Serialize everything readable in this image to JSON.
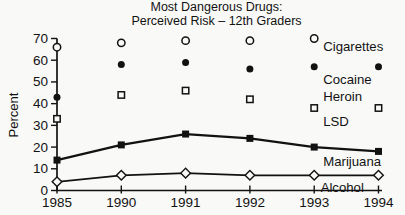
{
  "colors": {
    "ink": "#121212",
    "background": "#f9f9f7"
  },
  "chart_data": {
    "type": "scatter",
    "title_line1": "Most Dangerous Drugs:",
    "title_line2": "Perceived Risk – 12th Graders",
    "ylabel": "Percent",
    "categories": [
      "1985",
      "1990",
      "1991",
      "1992",
      "1993",
      "1994"
    ],
    "ylim": [
      0,
      70
    ],
    "yticks": [
      0,
      10,
      20,
      30,
      40,
      50,
      60,
      70
    ],
    "grid": "off",
    "legend": "inline-labels-right",
    "series": [
      {
        "name": "Cigarettes",
        "marker": "circle-open",
        "line": false,
        "values": [
          66,
          68,
          69,
          69,
          70,
          null
        ],
        "labels": [
          {
            "text": "Cigarettes",
            "x_index": 4.14,
            "y_value": 66.5
          }
        ]
      },
      {
        "name": "Cocaine",
        "marker": "circle-filled",
        "line": false,
        "values": [
          43,
          58,
          59,
          56,
          57,
          57
        ],
        "labels": [
          {
            "text": "Cocaine",
            "x_index": 4.14,
            "y_value": 51.3
          }
        ]
      },
      {
        "name": "Heroin / LSD",
        "marker": "square-open",
        "line": false,
        "values": [
          33,
          44,
          46,
          42,
          38,
          38
        ],
        "labels": [
          {
            "text": "Heroin",
            "x_index": 4.14,
            "y_value": 43.5
          },
          {
            "text": "LSD",
            "x_index": 4.14,
            "y_value": 31.8
          }
        ]
      },
      {
        "name": "Marijuana",
        "marker": "square-filled",
        "line": true,
        "values": [
          14,
          21,
          26,
          24,
          20,
          18
        ],
        "labels": [
          {
            "text": "Marijuana",
            "x_index": 4.14,
            "y_value": 13.2
          }
        ]
      },
      {
        "name": "Alcohol",
        "marker": "diamond-open",
        "line": true,
        "values": [
          4,
          7,
          8,
          7,
          7,
          7
        ],
        "labels": [
          {
            "text": "Alcohol",
            "x_index": 4.1,
            "y_value": 1.6
          }
        ]
      }
    ]
  }
}
